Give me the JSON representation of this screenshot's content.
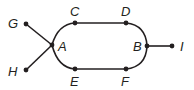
{
  "diagram": {
    "type": "graph",
    "colors": {
      "stroke": "#231f20",
      "background": "#ffffff"
    },
    "nodes": [
      {
        "id": "A",
        "label": "A",
        "x": 52,
        "y": 45,
        "lx": 58,
        "ly": 40
      },
      {
        "id": "B",
        "label": "B",
        "x": 147,
        "y": 46,
        "lx": 133,
        "ly": 40
      },
      {
        "id": "C",
        "label": "C",
        "x": 75,
        "y": 23,
        "lx": 70,
        "ly": 5
      },
      {
        "id": "D",
        "label": "D",
        "x": 126,
        "y": 23,
        "lx": 121,
        "ly": 5
      },
      {
        "id": "E",
        "label": "E",
        "x": 75,
        "y": 69,
        "lx": 70,
        "ly": 75
      },
      {
        "id": "F",
        "label": "F",
        "x": 126,
        "y": 69,
        "lx": 121,
        "ly": 75
      },
      {
        "id": "G",
        "label": "G",
        "x": 26,
        "y": 24,
        "lx": 8,
        "ly": 17
      },
      {
        "id": "H",
        "label": "H",
        "x": 26,
        "y": 70,
        "lx": 8,
        "ly": 65
      },
      {
        "id": "I",
        "label": "I",
        "x": 172,
        "y": 46,
        "lx": 180,
        "ly": 40
      }
    ],
    "edges": [
      [
        "G",
        "A"
      ],
      [
        "H",
        "A"
      ],
      [
        "A",
        "C"
      ],
      [
        "C",
        "D"
      ],
      [
        "D",
        "B"
      ],
      [
        "A",
        "E"
      ],
      [
        "E",
        "F"
      ],
      [
        "F",
        "B"
      ],
      [
        "B",
        "I"
      ]
    ]
  }
}
